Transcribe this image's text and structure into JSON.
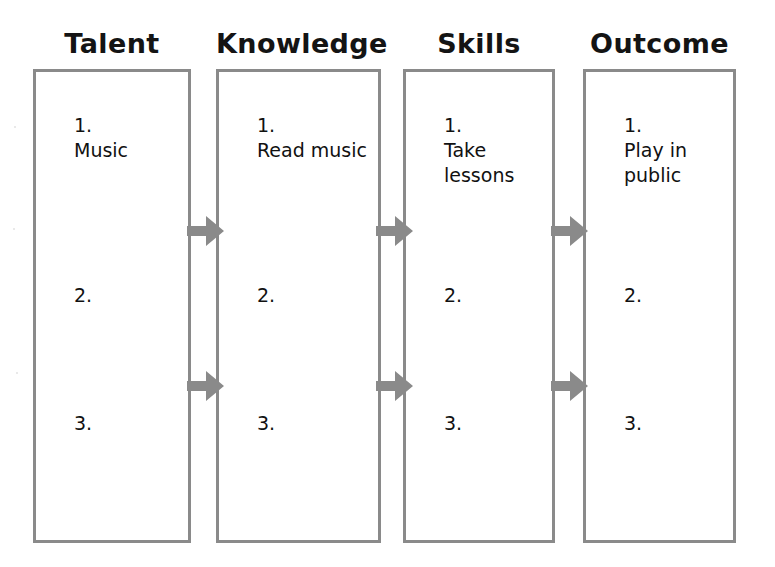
{
  "diagram": {
    "title_row": [
      "Talent",
      "Knowledge",
      "Skills",
      "Outcome"
    ],
    "columns": [
      {
        "header": "Talent",
        "items": [
          {
            "number": "1.",
            "text": "Music"
          },
          {
            "number": "2.",
            "text": ""
          },
          {
            "number": "3.",
            "text": ""
          }
        ]
      },
      {
        "header": "Knowledge",
        "items": [
          {
            "number": "1.",
            "text": "Read music"
          },
          {
            "number": "2.",
            "text": ""
          },
          {
            "number": "3.",
            "text": ""
          }
        ]
      },
      {
        "header": "Skills",
        "items": [
          {
            "number": "1.",
            "text": "Take lessons"
          },
          {
            "number": "2.",
            "text": ""
          },
          {
            "number": "3.",
            "text": ""
          }
        ]
      },
      {
        "header": "Outcome",
        "items": [
          {
            "number": "1.",
            "text": "Play in public"
          },
          {
            "number": "2.",
            "text": ""
          },
          {
            "number": "3.",
            "text": ""
          }
        ]
      }
    ],
    "connectors": [
      {
        "from": "Talent",
        "to": "Knowledge",
        "row": "upper",
        "icon": "right-arrow-icon"
      },
      {
        "from": "Knowledge",
        "to": "Skills",
        "row": "upper",
        "icon": "right-arrow-icon"
      },
      {
        "from": "Skills",
        "to": "Outcome",
        "row": "upper",
        "icon": "right-arrow-icon"
      },
      {
        "from": "Talent",
        "to": "Knowledge",
        "row": "lower",
        "icon": "right-arrow-icon"
      },
      {
        "from": "Knowledge",
        "to": "Skills",
        "row": "lower",
        "icon": "right-arrow-icon"
      },
      {
        "from": "Skills",
        "to": "Outcome",
        "row": "lower",
        "icon": "right-arrow-icon"
      }
    ],
    "colors": {
      "border": "#8a8a8a",
      "arrow": "#8a8a8a",
      "text": "#111111",
      "background": "#ffffff"
    }
  }
}
